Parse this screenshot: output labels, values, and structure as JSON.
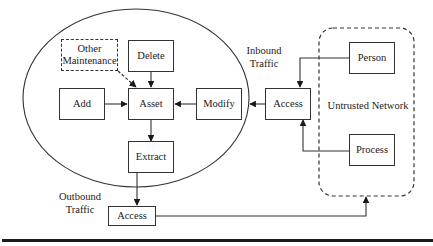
{
  "diagram": {
    "nodes": {
      "other_maintenance": {
        "line1": "Other",
        "line2": "Maintenance"
      },
      "delete": "Delete",
      "add": "Add",
      "asset": "Asset",
      "modify": "Modify",
      "extract": "Extract",
      "access_inbound": "Access",
      "access_outbound": "Access",
      "person": "Person",
      "process": "Process"
    },
    "labels": {
      "inbound_traffic": {
        "line1": "Inbound",
        "line2": "Traffic"
      },
      "outbound_traffic": {
        "line1": "Outbound",
        "line2": "Traffic"
      },
      "untrusted_network": "Untrusted Network"
    },
    "edges": [
      {
        "from": "Other Maintenance",
        "to": "Asset",
        "style": "dashed"
      },
      {
        "from": "Delete",
        "to": "Asset"
      },
      {
        "from": "Add",
        "to": "Asset"
      },
      {
        "from": "Modify",
        "to": "Asset"
      },
      {
        "from": "Asset",
        "to": "Extract"
      },
      {
        "from": "Access (inbound)",
        "to": "Modify"
      },
      {
        "from": "Person",
        "to": "Access (inbound)"
      },
      {
        "from": "Process",
        "to": "Access (inbound)"
      },
      {
        "from": "Extract",
        "to": "Access (outbound)"
      },
      {
        "from": "Access (outbound)",
        "to": "Untrusted Network"
      }
    ]
  }
}
